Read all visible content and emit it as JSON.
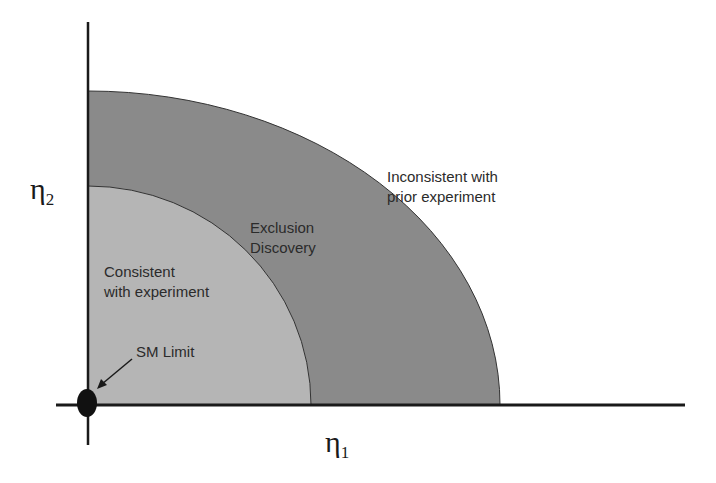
{
  "diagram": {
    "x_axis_label": "η",
    "x_axis_subscript": "1",
    "y_axis_label": "η",
    "y_axis_subscript": "2",
    "regions": [
      {
        "name": "consistent",
        "label_line1": "Consistent",
        "label_line2": "with experiment",
        "color": "#b5b5b5"
      },
      {
        "name": "exclusion-discovery",
        "label_line1": "Exclusion",
        "label_line2": "Discovery",
        "color": "#8a8a8a"
      },
      {
        "name": "inconsistent",
        "label_line1": "Inconsistent with",
        "label_line2": "prior experiment",
        "color": "#ffffff"
      }
    ],
    "sm_limit_label": "SM Limit"
  }
}
